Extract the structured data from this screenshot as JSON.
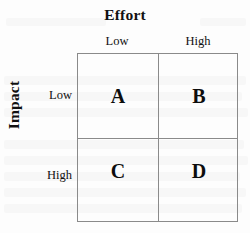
{
  "figure": {
    "type": "2x2-matrix",
    "x_axis": {
      "title": "Effort",
      "categories": [
        "Low",
        "High"
      ]
    },
    "y_axis": {
      "title": "Impact",
      "categories": [
        "Low",
        "High"
      ]
    },
    "quadrants": [
      {
        "label": "A",
        "impact": "Low",
        "effort": "Low"
      },
      {
        "label": "B",
        "impact": "Low",
        "effort": "High"
      },
      {
        "label": "C",
        "impact": "High",
        "effort": "Low"
      },
      {
        "label": "D",
        "impact": "High",
        "effort": "High"
      }
    ],
    "colors": {
      "background": "#fdfdfd",
      "grid_line": "#8a8a8a",
      "text": "#111111"
    }
  }
}
